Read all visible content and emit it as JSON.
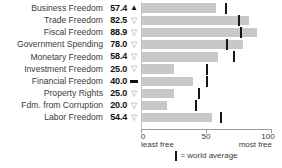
{
  "chart_data": {
    "type": "bar",
    "orientation": "horizontal",
    "title": "",
    "categories": [
      "Business Freedom",
      "Trade Freedom",
      "Fiscal Freedom",
      "Government Spending",
      "Monetary Freedom",
      "Investment Freedom",
      "Financial Freedom",
      "Property Rights",
      "Fdm. from Corruption",
      "Labor Freedom"
    ],
    "value_labels": [
      "57.4",
      "82.5",
      "88.9",
      "78.0",
      "58.4",
      "25.0",
      "40.0",
      "25.0",
      "20.0",
      "54.4"
    ],
    "series": [
      {
        "name": "country score",
        "values": [
          57.4,
          82.5,
          88.9,
          78.0,
          58.4,
          25.0,
          40.0,
          25.0,
          20.0,
          54.4
        ]
      },
      {
        "name": "world average",
        "values": [
          65,
          75,
          76.5,
          66,
          71,
          50,
          50,
          44,
          42,
          61
        ]
      }
    ],
    "change_indicators": [
      "up",
      "down",
      "down",
      "down",
      "down",
      "down",
      "none",
      "down",
      "down",
      "down"
    ],
    "xlim": [
      0,
      100
    ],
    "ticks": [
      "0",
      "50",
      "100"
    ],
    "axis_caption_left": "least free",
    "axis_caption_right": "most free",
    "legend_text": "= world average",
    "bar_color": "#c8c8c8",
    "marker_color": "#161616",
    "grid": false,
    "legend_position": "bottom-center"
  },
  "icons": {
    "up": "▲",
    "down": "▽"
  }
}
